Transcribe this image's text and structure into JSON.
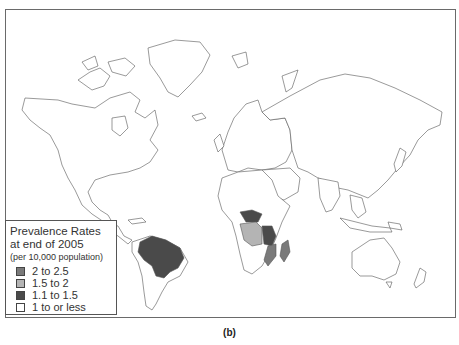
{
  "figure": {
    "caption": "(b)",
    "legend": {
      "title_line1": "Prevalence Rates",
      "title_line2": "at end of 2005",
      "subtitle": "(per 10,000 population)",
      "items": [
        {
          "label": "2 to 2.5",
          "color": "#7a7a7a"
        },
        {
          "label": "1.5 to 2",
          "color": "#b4b4b4"
        },
        {
          "label": "1.1 to 1.5",
          "color": "#4a4a4a"
        },
        {
          "label": "1 to or less",
          "color": "#ffffff"
        }
      ]
    },
    "highlighted_countries": [
      {
        "name": "Brazil",
        "category": "1.1 to 1.5"
      },
      {
        "name": "Central African Republic",
        "category": "1.1 to 1.5"
      },
      {
        "name": "DR Congo",
        "category": "1.5 to 2"
      },
      {
        "name": "Tanzania",
        "category": "1.1 to 1.5"
      },
      {
        "name": "Mozambique",
        "category": "2 to 2.5"
      },
      {
        "name": "Madagascar",
        "category": "2 to 2.5"
      }
    ]
  }
}
